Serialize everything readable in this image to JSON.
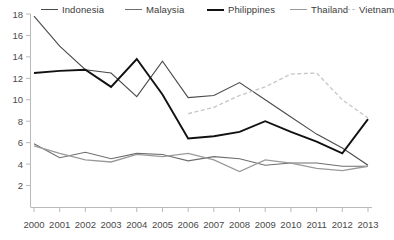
{
  "chart_data": {
    "type": "line",
    "title": "",
    "subtitle": "",
    "xlabel": "",
    "ylabel": "",
    "x": [
      2000,
      2001,
      2002,
      2003,
      2004,
      2005,
      2006,
      2007,
      2008,
      2009,
      2010,
      2011,
      2012,
      2013
    ],
    "xtick_labels": [
      "2000",
      "2001",
      "2002",
      "2003",
      "2004",
      "2005",
      "2006",
      "2007",
      "2008",
      "2009",
      "2010",
      "2011",
      "2012",
      "2013"
    ],
    "ytick_labels": [
      "2",
      "4",
      "6",
      "8",
      "10",
      "12",
      "14",
      "16",
      "18"
    ],
    "ytick_values": [
      2,
      4,
      6,
      8,
      10,
      12,
      14,
      16,
      18
    ],
    "xlim": [
      2000,
      2013
    ],
    "ylim": [
      0,
      18
    ],
    "grid": false,
    "legend_position": "top",
    "series": [
      {
        "name": "Indonesia",
        "color": "#4a4a4a",
        "width": 1.1,
        "dash": "none",
        "values": [
          17.8,
          15.0,
          12.8,
          12.5,
          10.3,
          13.6,
          10.2,
          10.4,
          11.6,
          10.0,
          8.4,
          6.8,
          5.5,
          3.9
        ]
      },
      {
        "name": "Malaysia",
        "color": "#6e6e6e",
        "width": 1.1,
        "dash": "none",
        "values": [
          5.9,
          4.6,
          5.1,
          4.5,
          5.0,
          4.9,
          4.3,
          4.7,
          4.5,
          3.9,
          4.1,
          4.1,
          3.8,
          3.8
        ]
      },
      {
        "name": "Philippines",
        "color": "#111111",
        "width": 1.9,
        "dash": "none",
        "values": [
          12.5,
          12.7,
          12.8,
          11.2,
          13.8,
          10.5,
          6.4,
          6.6,
          7.0,
          8.0,
          7.0,
          6.1,
          5.0,
          8.2
        ]
      },
      {
        "name": "Thailand",
        "color": "#9a9a9a",
        "width": 1.3,
        "dash": "none",
        "values": [
          5.7,
          5.0,
          4.4,
          4.2,
          4.9,
          4.7,
          5.0,
          4.4,
          3.3,
          4.4,
          4.1,
          3.6,
          3.4,
          3.8
        ]
      },
      {
        "name": "Vietnam",
        "color": "#c6c6c6",
        "width": 1.3,
        "dash": "4 2.5",
        "start_index": 6,
        "values": [
          null,
          null,
          null,
          null,
          null,
          null,
          8.7,
          9.3,
          10.4,
          11.2,
          12.4,
          12.5,
          10.0,
          8.3
        ]
      }
    ]
  }
}
